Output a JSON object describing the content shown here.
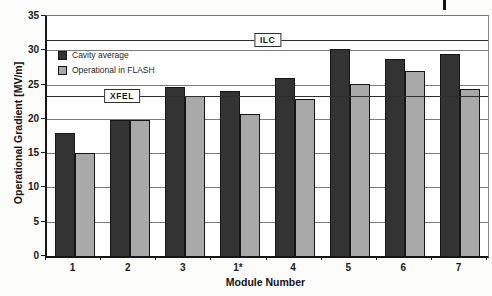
{
  "figure": {
    "background": "#fcfcfb",
    "has_page_margin_mark": true
  },
  "chart_data": {
    "type": "bar",
    "title": "",
    "xlabel": "Module Number",
    "ylabel": "Operational Gradient [MV/m]",
    "ylim": [
      0,
      35
    ],
    "ytick_step": 5,
    "grid": true,
    "legend_position": "upper-left-inside",
    "categories": [
      "1",
      "2",
      "3",
      "1*",
      "4",
      "5",
      "6",
      "7"
    ],
    "series": [
      {
        "name": "Cavity average",
        "color": "#333333",
        "values": [
          17.9,
          19.8,
          24.6,
          24.0,
          25.9,
          30.2,
          28.8,
          29.5
        ]
      },
      {
        "name": "Operational in FLASH",
        "color": "#a9a9a9",
        "values": [
          15.0,
          19.8,
          23.3,
          20.7,
          22.9,
          25.1,
          27.0,
          24.4
        ]
      }
    ],
    "reference_lines": [
      {
        "label": "ILC",
        "value": 31.5,
        "label_x_percent": 50
      },
      {
        "label": "XFEL",
        "value": 23.3,
        "label_x_percent": 17
      }
    ]
  }
}
